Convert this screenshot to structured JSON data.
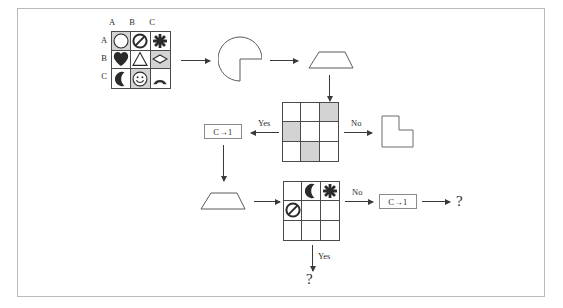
{
  "diagram": {
    "colors": {
      "frame_border": "#b9b9b9",
      "grid_line": "#4a4a4a",
      "shaded_cell": "#d3d3d3",
      "arrow": "#3a3a3a",
      "text": "#2b2b2b",
      "box_border": "#8a8a8a"
    },
    "grid1": {
      "name": "symbol-grid",
      "col_labels": [
        "A",
        "B",
        "C"
      ],
      "row_labels": [
        "A",
        "B",
        "C"
      ],
      "cells": [
        {
          "icon": "circle-icon",
          "shaded": true
        },
        {
          "icon": "no-entry-icon",
          "shaded": false
        },
        {
          "icon": "sparkle-icon",
          "shaded": false
        },
        {
          "icon": "heart-icon",
          "shaded": false
        },
        {
          "icon": "triangle-icon",
          "shaded": false
        },
        {
          "icon": "diamond-icon",
          "shaded": true
        },
        {
          "icon": "crescent-moon-icon",
          "shaded": false
        },
        {
          "icon": "smiley-face-icon",
          "shaded": true
        },
        {
          "icon": "arc-icon",
          "shaded": false
        }
      ]
    },
    "grid2": {
      "name": "shading-pattern-grid",
      "cells": [
        {
          "icon": "",
          "shaded": false
        },
        {
          "icon": "",
          "shaded": false
        },
        {
          "icon": "",
          "shaded": true
        },
        {
          "icon": "",
          "shaded": true
        },
        {
          "icon": "",
          "shaded": false
        },
        {
          "icon": "",
          "shaded": false
        },
        {
          "icon": "",
          "shaded": false
        },
        {
          "icon": "",
          "shaded": true
        },
        {
          "icon": "",
          "shaded": false
        }
      ]
    },
    "grid3": {
      "name": "partial-symbol-grid",
      "cells": [
        {
          "icon": "",
          "shaded": false
        },
        {
          "icon": "crescent-moon-icon",
          "shaded": false
        },
        {
          "icon": "sparkle-icon",
          "shaded": false
        },
        {
          "icon": "no-entry-icon",
          "shaded": false
        },
        {
          "icon": "",
          "shaded": false
        },
        {
          "icon": "",
          "shaded": false
        },
        {
          "icon": "",
          "shaded": false
        },
        {
          "icon": "",
          "shaded": false
        },
        {
          "icon": "",
          "shaded": false
        }
      ]
    },
    "shapes": {
      "pacman": "pacman-shape",
      "trapezoid_top": "trapezoid-shape",
      "trapezoid_bottom": "trapezoid-shape",
      "l_polygon": "l-shape"
    },
    "labels": {
      "yes_top": "Yes",
      "no_top": "No",
      "no_bottom": "No",
      "yes_bottom": "Yes"
    },
    "rule_boxes": {
      "top": "C→1",
      "bottom": "C→1"
    },
    "outputs": {
      "right": "?",
      "bottom": "?"
    }
  }
}
